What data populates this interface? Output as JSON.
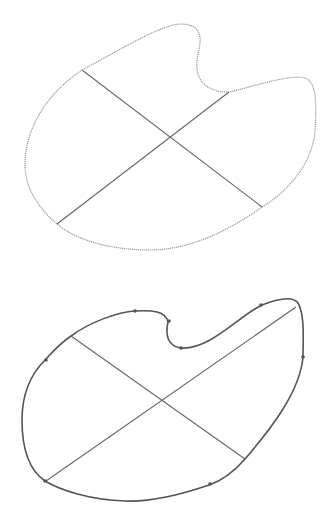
{
  "figure": {
    "colors": {
      "background": "#ffffff",
      "top_outline": "#9a9a9a",
      "bottom_outline": "#555555",
      "cross_lines": "#666666",
      "control_points": "#555555"
    },
    "top_shape": {
      "style": "dotted sketch outline",
      "path": "M 82,70 C 120,50 160,25 180,24 C 200,24 202,35 199,50 C 195,65 196,76 205,85 C 214,92 224,92 229,92 C 260,85 290,74 305,78 C 318,82 316,110 315,130 C 313,162 290,190 262,207 C 230,230 190,250 150,250 C 110,250 76,240 57,224 C 35,205 25,185 25,165 C 25,130 45,95 82,70 Z",
      "lines": [
        {
          "x1": 82,
          "y1": 70,
          "x2": 262,
          "y2": 207
        },
        {
          "x1": 229,
          "y1": 92,
          "x2": 57,
          "y2": 224
        }
      ]
    },
    "bottom_shape": {
      "style": "smooth fitted contour with control points",
      "path": "M 71,336 C 90,322 118,312 135,311 C 152,310 166,311 168,322 C 165,336 168,346 181,348 C 210,350 240,315 262,305 C 280,298 293,296 298,303 C 305,315 303,340 303,357 C 300,392 270,430 245,459 C 232,474 218,482 209,485 C 180,495 150,502 125,501 C 90,500 60,490 45,481 C 26,468 22,442 22,420 C 22,395 30,375 45,360 C 55,349 62,342 71,336 Z",
      "lines": [
        {
          "x1": 71,
          "y1": 336,
          "x2": 245,
          "y2": 459
        },
        {
          "x1": 296,
          "y1": 307,
          "x2": 46,
          "y2": 481
        }
      ],
      "control_points": [
        {
          "x": 135,
          "y": 311
        },
        {
          "x": 169,
          "y": 321
        },
        {
          "x": 181,
          "y": 348
        },
        {
          "x": 261,
          "y": 305
        },
        {
          "x": 303,
          "y": 357
        },
        {
          "x": 46,
          "y": 360
        },
        {
          "x": 210,
          "y": 484
        },
        {
          "x": 45,
          "y": 481
        }
      ]
    }
  }
}
